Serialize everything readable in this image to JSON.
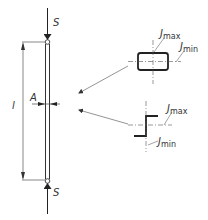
{
  "diagram": {
    "type": "buckling-column",
    "colors": {
      "line": "#333333",
      "thin": "#666666",
      "background": "#ffffff"
    },
    "labels": {
      "force_top": "S",
      "force_bottom": "S",
      "length": "l",
      "axis_point": "A",
      "rect_jmax_main": "J",
      "rect_jmax_sub": "max",
      "rect_jmin_main": "J",
      "rect_jmin_sub": "min",
      "z_jmax_main": "J",
      "z_jmax_sub": "max",
      "z_jmin_main": "J",
      "z_jmin_sub": "min"
    },
    "cross_sections": [
      {
        "name": "rectangular-section",
        "axes": [
          "Jmax",
          "Jmin"
        ]
      },
      {
        "name": "z-section",
        "axes": [
          "Jmax",
          "Jmin"
        ]
      }
    ]
  }
}
